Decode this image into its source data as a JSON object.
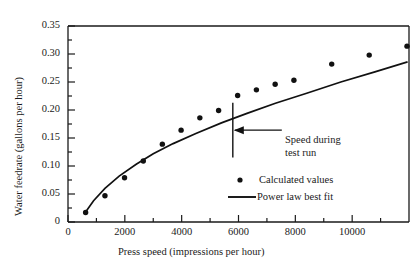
{
  "chart_data": {
    "type": "scatter",
    "title": "",
    "xlabel": "Press speed (impressions per hour)",
    "ylabel": "Water feedrate (gallons per hour)",
    "xlim": [
      0,
      12000
    ],
    "ylim": [
      0,
      0.35
    ],
    "xticks": [
      0,
      2000,
      4000,
      6000,
      8000,
      10000
    ],
    "xticklabels": [
      "0",
      "2000",
      "4000",
      "6000",
      "8000",
      "10000"
    ],
    "xminorticks": [
      1000,
      3000,
      5000,
      7000,
      9000,
      11000
    ],
    "yticks": [
      0,
      0.05,
      0.1,
      0.15,
      0.2,
      0.25,
      0.3,
      0.35
    ],
    "yticklabels": [
      "0",
      "0.05",
      "0.10",
      "0.15",
      "0.20",
      "0.25",
      "0.30",
      "0.35"
    ],
    "yminorticks": [
      0.025,
      0.075,
      0.125,
      0.175,
      0.225,
      0.275,
      0.325
    ],
    "grid": false,
    "legend_position": "inside-lower-right",
    "series": [
      {
        "name": "Calculated values",
        "type": "scatter",
        "marker": "filled-circle",
        "color": "#111111",
        "points": [
          {
            "x": 620,
            "y": 0.017
          },
          {
            "x": 1300,
            "y": 0.047
          },
          {
            "x": 1990,
            "y": 0.079
          },
          {
            "x": 2650,
            "y": 0.109
          },
          {
            "x": 3320,
            "y": 0.139
          },
          {
            "x": 3980,
            "y": 0.164
          },
          {
            "x": 4640,
            "y": 0.186
          },
          {
            "x": 5300,
            "y": 0.199
          },
          {
            "x": 5970,
            "y": 0.226
          },
          {
            "x": 6630,
            "y": 0.236
          },
          {
            "x": 7290,
            "y": 0.246
          },
          {
            "x": 7950,
            "y": 0.253
          },
          {
            "x": 9280,
            "y": 0.282
          },
          {
            "x": 10600,
            "y": 0.298
          },
          {
            "x": 11930,
            "y": 0.314
          }
        ]
      },
      {
        "name": "Power law best fit",
        "type": "line",
        "color": "#111111",
        "points": [
          {
            "x": 620,
            "y": 0.018
          },
          {
            "x": 900,
            "y": 0.038
          },
          {
            "x": 1300,
            "y": 0.06
          },
          {
            "x": 1800,
            "y": 0.082
          },
          {
            "x": 2400,
            "y": 0.103
          },
          {
            "x": 3000,
            "y": 0.122
          },
          {
            "x": 3700,
            "y": 0.14
          },
          {
            "x": 4500,
            "y": 0.158
          },
          {
            "x": 5400,
            "y": 0.177
          },
          {
            "x": 6300,
            "y": 0.194
          },
          {
            "x": 7300,
            "y": 0.212
          },
          {
            "x": 8400,
            "y": 0.23
          },
          {
            "x": 9600,
            "y": 0.25
          },
          {
            "x": 10800,
            "y": 0.268
          },
          {
            "x": 11950,
            "y": 0.286
          }
        ]
      }
    ],
    "annotations": [
      {
        "name": "speed-during-test-run",
        "text_line1": "Speed during",
        "text_line2": "test run",
        "marker_x": 5800,
        "marker_y_top": 0.213,
        "marker_y_bottom": 0.115
      }
    ],
    "legend_entries": [
      {
        "label": "Calculated values",
        "marker": "dot"
      },
      {
        "label": "Power law best fit",
        "marker": "line"
      }
    ]
  }
}
